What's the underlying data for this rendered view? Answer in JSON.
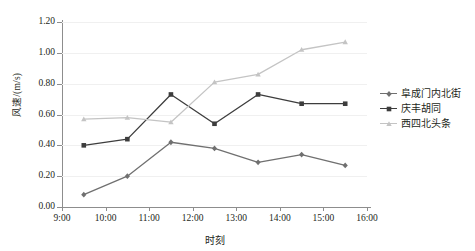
{
  "chart_data": {
    "type": "line",
    "title": "",
    "xlabel": "时刻",
    "ylabel": "风速/(m/s)",
    "x": [
      "9:30",
      "10:30",
      "11:30",
      "12:30",
      "13:30",
      "14:30",
      "15:30"
    ],
    "xtick_labels": [
      "9:00",
      "10:00",
      "11:00",
      "12:00",
      "13:00",
      "14:00",
      "15:00",
      "16:00"
    ],
    "ytick_labels": [
      "0.00",
      "0.20",
      "0.40",
      "0.60",
      "0.80",
      "1.00",
      "1.20"
    ],
    "xlim": [
      "9:00",
      "16:00"
    ],
    "ylim": [
      0.0,
      1.2
    ],
    "grid": true,
    "legend_position": "right",
    "series": [
      {
        "name": "阜成门内北街",
        "color": "#707070",
        "marker": "diamond",
        "values": [
          0.08,
          0.2,
          0.42,
          0.38,
          0.29,
          0.34,
          0.27
        ]
      },
      {
        "name": "庆丰胡同",
        "color": "#3d3d3d",
        "marker": "square",
        "values": [
          0.4,
          0.44,
          0.73,
          0.54,
          0.73,
          0.67,
          0.67
        ]
      },
      {
        "name": "西四北头条",
        "color": "#c4c4c4",
        "marker": "triangle",
        "values": [
          0.57,
          0.58,
          0.55,
          0.81,
          0.86,
          1.02,
          1.07
        ]
      }
    ]
  },
  "legend": {
    "items": [
      {
        "label": "阜成门内北街"
      },
      {
        "label": "庆丰胡同"
      },
      {
        "label": "西四北头条"
      }
    ]
  },
  "axes": {
    "y_title": "风速/(m/s)",
    "x_title": "时刻"
  }
}
